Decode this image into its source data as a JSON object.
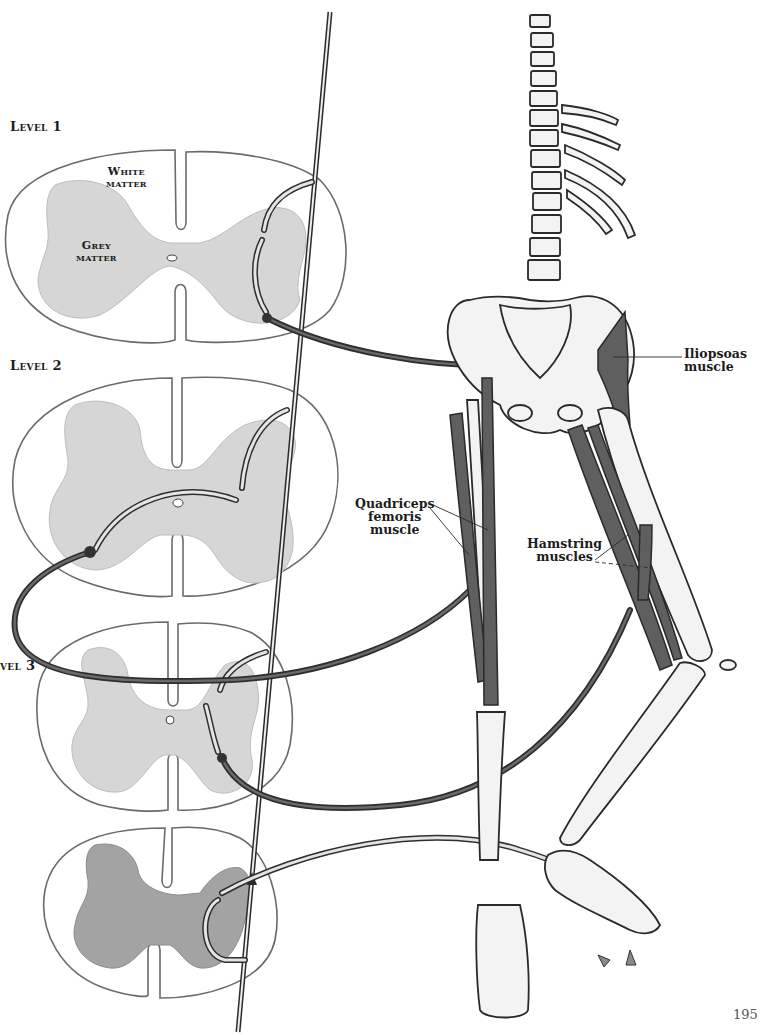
{
  "figure": {
    "type": "anatomical-illustration"
  },
  "spinal_levels": [
    {
      "label": "Level 1"
    },
    {
      "label": "Level 2"
    },
    {
      "label": "vel 3"
    }
  ],
  "cord_labels": {
    "white_matter_line1": "White",
    "white_matter_line2": "matter",
    "grey_matter_line1": "Grey",
    "grey_matter_line2": "matter"
  },
  "muscle_labels": {
    "iliopsoas_line1": "Iliopsoas",
    "iliopsoas_line2": "muscle",
    "quadriceps_line1": "Quadriceps",
    "quadriceps_line2": "femoris",
    "quadriceps_line3": "muscle",
    "hamstring_line1": "Hamstring",
    "hamstring_line2": "muscles"
  },
  "page": {
    "number": "195"
  },
  "colors": {
    "grey_matter": "#d4d4d4",
    "grey_matter_dark": "#9a9a9a",
    "muscle": "#5e5e5e",
    "nerve_dark": "#3a3a3a",
    "bone_fill": "#f2f2f2",
    "outline": "#2a2a2a"
  }
}
